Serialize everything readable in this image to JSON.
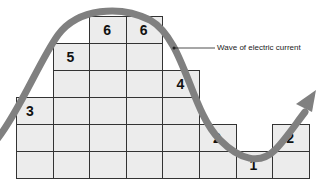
{
  "diagram": {
    "label": "Wave of electric current",
    "columns": [
      {
        "value": "3",
        "height": 3
      },
      {
        "value": "5",
        "height": 5
      },
      {
        "value": "6",
        "height": 6
      },
      {
        "value": "6",
        "height": 6
      },
      {
        "value": "4",
        "height": 4
      },
      {
        "value": "2",
        "height": 2
      },
      {
        "value": "1",
        "height": 1
      },
      {
        "value": "2",
        "height": 2
      }
    ],
    "colors": {
      "cell": "#ececec",
      "grid_line": "#333333",
      "wave": "#808080",
      "text": "#111111"
    }
  }
}
